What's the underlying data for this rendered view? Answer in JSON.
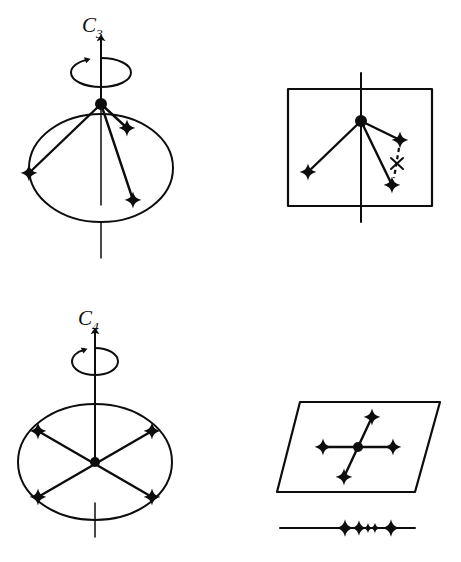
{
  "figure": {
    "ink_color": "#0d0d0d",
    "background_color": "#ffffff",
    "width": 461,
    "height": 562
  },
  "panels": {
    "top_left": {
      "name": "c3-axis-cone",
      "axis_label": "C",
      "axis_order": "3",
      "description": "Threefold rotation axis through apex atom of a trigonal pyramid drawn in perspective with an ellipse base",
      "apex_atom": "sphere",
      "ligand_count": 3,
      "ligand_marker": "diamond"
    },
    "top_right": {
      "name": "c3-mirror-plane-rectangle",
      "description": "Rectangular mirror plane with vertical line; central atom with three diamond ligands; dashed segment crossed out by an x",
      "crossed_out_marker": "×",
      "ligand_count": 3,
      "ligand_marker": "diamond",
      "reflection_allowed": "no"
    },
    "bottom_left": {
      "name": "c4-axis-planar",
      "axis_label": "C",
      "axis_order": "4",
      "description": "Fourfold rotation axis perpendicular to a square-planar arrangement drawn as an ellipse with four diamond ligands",
      "center_atom": "sphere",
      "ligand_count": 4,
      "ligand_marker": "diamond"
    },
    "bottom_right": {
      "name": "c4-plane-parallelogram",
      "description": "Square-planar molecule viewed in the plane, drawn inside a parallelogram",
      "ligand_count": 4,
      "ligand_marker": "diamond",
      "center_atom": "sphere"
    },
    "bottom_edge": {
      "name": "c4-edge-on-view",
      "description": "Edge-on view of the square-planar molecule showing overlapping atoms along a horizontal line",
      "marker_count": 5,
      "ligand_marker": "diamond"
    }
  },
  "labels": {
    "c3": {
      "letter": "C",
      "subscript": "3"
    },
    "c4": {
      "letter": "C",
      "subscript": "4"
    },
    "cross_mark": "×"
  }
}
